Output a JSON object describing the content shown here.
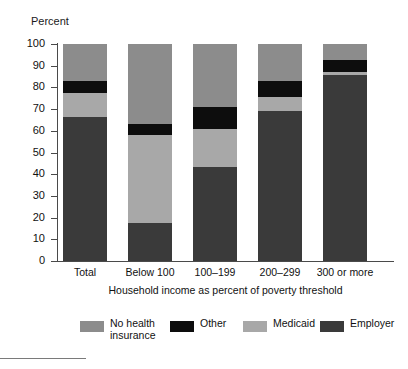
{
  "top_clipped_text": "",
  "axis": {
    "y_title": "Percent",
    "x_title": "Household income as percent of poverty threshold",
    "y_ticks": [
      "0",
      "10",
      "20",
      "30",
      "40",
      "50",
      "60",
      "70",
      "80",
      "90",
      "100"
    ],
    "y_min": 0,
    "y_max": 100
  },
  "colors": {
    "no_health_insurance": "#8c8c8c",
    "other": "#0d0d0d",
    "medicaid": "#a8a8a8",
    "employer": "#3a3a3a",
    "axis": "#4a4a4a",
    "text": "#111111",
    "background": "#ffffff"
  },
  "legend": [
    {
      "label": "No health insurance",
      "color_key": "no_health_insurance",
      "swatch": "#8c8c8c"
    },
    {
      "label": "Other",
      "color_key": "other",
      "swatch": "#0d0d0d"
    },
    {
      "label": "Medicaid",
      "color_key": "medicaid",
      "swatch": "#a8a8a8"
    },
    {
      "label": "Employer",
      "color_key": "employer",
      "swatch": "#3a3a3a"
    }
  ],
  "chart_data": {
    "type": "bar",
    "subtype": "stacked-100",
    "title": "",
    "xlabel": "Household income as percent of poverty threshold",
    "ylabel": "Percent",
    "ylim": [
      0,
      100
    ],
    "ytick_step": 10,
    "grid": false,
    "legend_position": "bottom",
    "categories": [
      "Total",
      "Below 100",
      "100–199",
      "200–299",
      "300 or more"
    ],
    "series": [
      {
        "name": "Employer",
        "color": "#3a3a3a",
        "values": [
          66.5,
          17.5,
          43.5,
          69.0,
          85.5
        ]
      },
      {
        "name": "Medicaid",
        "color": "#a8a8a8",
        "values": [
          11.0,
          40.5,
          17.5,
          6.5,
          1.5
        ]
      },
      {
        "name": "Other",
        "color": "#0d0d0d",
        "values": [
          5.5,
          5.0,
          10.0,
          7.5,
          5.5
        ]
      },
      {
        "name": "No health insurance",
        "color": "#8c8c8c",
        "values": [
          17.0,
          37.0,
          29.0,
          17.0,
          7.5
        ]
      }
    ],
    "stack_order_bottom_to_top": [
      "Employer",
      "Medicaid",
      "Other",
      "No health insurance"
    ],
    "cumulative_tops": {
      "Total": {
        "Employer": 66.5,
        "Medicaid": 77.5,
        "Other": 83.0,
        "No health insurance": 100
      },
      "Below 100": {
        "Employer": 17.5,
        "Medicaid": 58.0,
        "Other": 63.0,
        "No health insurance": 100
      },
      "100–199": {
        "Employer": 43.5,
        "Medicaid": 61.0,
        "Other": 71.0,
        "No health insurance": 100
      },
      "200–299": {
        "Employer": 69.0,
        "Medicaid": 75.5,
        "Other": 83.0,
        "No health insurance": 100
      },
      "300 or more": {
        "Employer": 85.5,
        "Medicaid": 87.0,
        "Other": 92.5,
        "No health insurance": 100
      }
    }
  }
}
